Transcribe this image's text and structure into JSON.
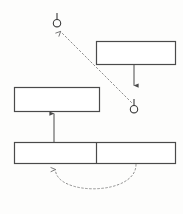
{
  "diagram": {
    "type": "uml-component-diagram",
    "canvas": {
      "width": 183,
      "height": 214,
      "background": "#fdfdfc"
    },
    "colors": {
      "box_stroke": "#4a4a4a",
      "box_fill": "#ffffff",
      "connector_solid": "#4a4a4a",
      "connector_dashed": "#8d8d8d",
      "lollipop_stroke": "#3a3a3a",
      "background": "#fdfdfc"
    },
    "boxes": [
      {
        "id": "box-top-right",
        "label": "",
        "x": 96,
        "y": 41,
        "width": 80,
        "height": 24,
        "divider_x": null
      },
      {
        "id": "box-middle-left",
        "label": "",
        "x": 14,
        "y": 87,
        "width": 86,
        "height": 25,
        "divider_x": null
      },
      {
        "id": "box-bottom-wide",
        "label": "",
        "x": 14,
        "y": 142,
        "width": 162,
        "height": 22,
        "divider_x": 96
      }
    ],
    "lollipops": [
      {
        "id": "lollipop-top-left",
        "cx": 57,
        "cy": 23,
        "r": 4,
        "stem_top_y": 13,
        "stem_bottom_y": 19
      },
      {
        "id": "lollipop-mid-right",
        "cx": 134,
        "cy": 109,
        "r": 4,
        "stem_top_y": 99,
        "stem_bottom_y": 105
      }
    ],
    "connectors": [
      {
        "id": "arrow-top-right-box-down",
        "style": "solid",
        "from": {
          "x": 134,
          "y": 65
        },
        "to": {
          "x": 134,
          "y": 87
        },
        "arrowhead": "down"
      },
      {
        "id": "arrow-bottom-box-up-to-middle-box",
        "style": "solid",
        "from": {
          "x": 54,
          "y": 142
        },
        "to": {
          "x": 54,
          "y": 112
        },
        "arrowhead": "up"
      },
      {
        "id": "dashed-diagonal-dependency",
        "style": "dashed",
        "from": {
          "x": 132,
          "y": 102
        },
        "to": {
          "x": 59,
          "y": 30
        },
        "arrowhead": "up-left"
      },
      {
        "id": "dashed-return-arc",
        "style": "dashed",
        "from": {
          "x": 136,
          "y": 164
        },
        "to": {
          "x": 55,
          "y": 167
        },
        "arrowhead": "up",
        "shape": "semicircle-below"
      }
    ]
  }
}
